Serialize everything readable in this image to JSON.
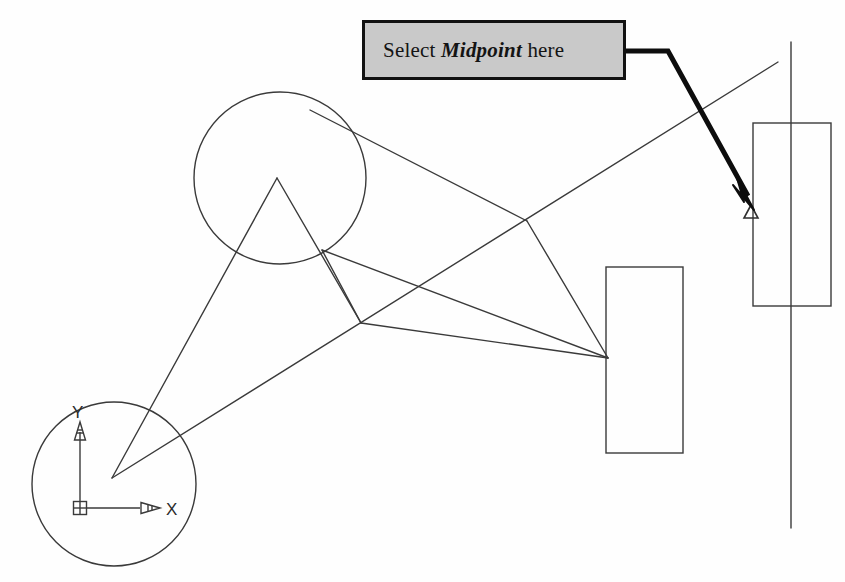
{
  "figure": {
    "kind": "cad-drawing-screenshot",
    "background_color": "#fefefe",
    "line_color": "#3a3a3a",
    "callout": {
      "text_prefix": "Select ",
      "emphasis": "Midpoint",
      "text_suffix": " here",
      "full_text": "Select Midpoint here",
      "fill_color": "#c9c9c9",
      "border_color": "#111111",
      "x": 362,
      "y": 20,
      "width": 264,
      "height": 60
    },
    "leader": {
      "color": "#0d0d0d",
      "width": 5,
      "points": [
        [
          626,
          51
        ],
        [
          668,
          51
        ],
        [
          753,
          205
        ]
      ],
      "arrow_tip": [
        753,
        207
      ]
    },
    "osnap_marker": {
      "type": "midpoint-triangle",
      "x": 751,
      "y": 213,
      "size": 13,
      "color": "#3a3a3a"
    },
    "ucs_icon": {
      "origin": [
        80,
        508
      ],
      "y_axis_label": "Y",
      "x_axis_label": "X",
      "y_tip": [
        80,
        424
      ],
      "x_tip": [
        152,
        508
      ],
      "box_size": 13
    },
    "circles": [
      {
        "name": "upper-circle",
        "cx": 280,
        "cy": 178,
        "r": 86
      },
      {
        "name": "ucs-circle",
        "cx": 114,
        "cy": 484,
        "r": 82
      }
    ],
    "rectangles": [
      {
        "name": "middle-rectangle",
        "x": 606,
        "y": 267,
        "width": 77,
        "height": 186
      },
      {
        "name": "right-rectangle",
        "x": 753,
        "y": 123,
        "width": 78,
        "height": 183
      }
    ],
    "lines": [
      {
        "name": "vertical-construction-line",
        "x1": 791,
        "y1": 42,
        "x2": 791,
        "y2": 528
      },
      {
        "name": "long-diagonal",
        "x1": 112,
        "y1": 478,
        "x2": 778,
        "y2": 62
      },
      {
        "name": "apex-to-origin",
        "x1": 277,
        "y1": 178,
        "x2": 112,
        "y2": 478
      },
      {
        "name": "apex-to-lower-vertex",
        "x1": 277,
        "y1": 178,
        "x2": 361,
        "y2": 323
      },
      {
        "name": "circle-edge-to-upper-vertex",
        "x1": 310,
        "y1": 110,
        "x2": 527,
        "y2": 221
      },
      {
        "name": "upper-vertex-to-rect",
        "x1": 527,
        "y1": 221,
        "x2": 608,
        "y2": 358
      },
      {
        "name": "circle-tangent-to-lower-vertex",
        "x1": 322,
        "y1": 250,
        "x2": 361,
        "y2": 323
      },
      {
        "name": "circle-edge-to-rect-upper",
        "x1": 322,
        "y1": 250,
        "x2": 608,
        "y2": 358
      },
      {
        "name": "lower-vertex-to-rect",
        "x1": 361,
        "y1": 323,
        "x2": 608,
        "y2": 358
      }
    ]
  }
}
